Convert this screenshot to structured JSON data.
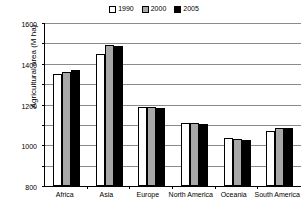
{
  "chart_data": {
    "type": "bar",
    "title": "",
    "xlabel": "",
    "ylabel": "Agricultural area (M ha)",
    "ylim": [
      0,
      1600
    ],
    "ytick_step": 200,
    "yticks": [
      0,
      200,
      400,
      600,
      800,
      1000,
      1200,
      1400,
      1600
    ],
    "ytick_labels": [
      "0",
      "200",
      "400",
      "600",
      "800",
      "1000",
      "1200",
      "1400",
      "1600"
    ],
    "grid": "horizontal",
    "legend_position": "top-center",
    "categories": [
      "Africa",
      "Asia",
      "Europe",
      "North America",
      "Oceania",
      "South America"
    ],
    "series": [
      {
        "name": "1990",
        "color": "#ffffff",
        "values": [
          1100,
          1300,
          780,
          620,
          470,
          540
        ]
      },
      {
        "name": "2000",
        "color": "#a8a8a8",
        "values": [
          1120,
          1380,
          775,
          615,
          465,
          565
        ]
      },
      {
        "name": "2005",
        "color": "#000000",
        "values": [
          1140,
          1375,
          765,
          610,
          450,
          565
        ]
      }
    ]
  }
}
